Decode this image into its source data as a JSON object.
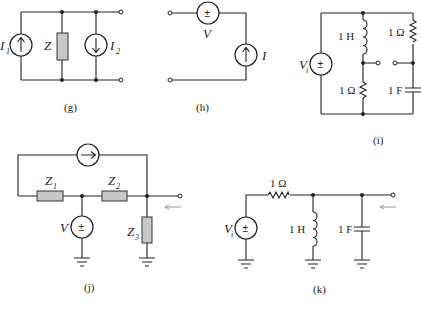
{
  "figure": {
    "circuits": [
      {
        "id": "g",
        "caption": "(g)",
        "labels": {
          "I1": "I",
          "I1_sub": "1",
          "Z": "Z",
          "I2": "I",
          "I2_sub": "2"
        }
      },
      {
        "id": "h",
        "caption": "(h)",
        "labels": {
          "V": "V",
          "I": "I",
          "plus_minus": "±"
        }
      },
      {
        "id": "i",
        "caption": "(i)",
        "labels": {
          "Vi": "V",
          "Vi_sub": "i",
          "L1": "1 H",
          "R1": "1 Ω",
          "R2": "1 Ω",
          "C1": "1 F",
          "plus_minus": "±"
        }
      },
      {
        "id": "j",
        "caption": "(j)",
        "labels": {
          "Z1": "Z",
          "Z1_sub": "1",
          "Z2": "Z",
          "Z2_sub": "2",
          "Z3": "Z",
          "Z3_sub": "3",
          "V": "V",
          "plus_minus": "±"
        }
      },
      {
        "id": "k",
        "caption": "(k)",
        "labels": {
          "Vi": "V",
          "Vi_sub": "i",
          "R1": "1 Ω",
          "L1": "1 H",
          "C1": "1 F",
          "plus_minus": "±"
        }
      }
    ],
    "colors": {
      "wire": "#222222",
      "impedance_fill": "#c8c8c8",
      "arrow": "#999999"
    }
  }
}
